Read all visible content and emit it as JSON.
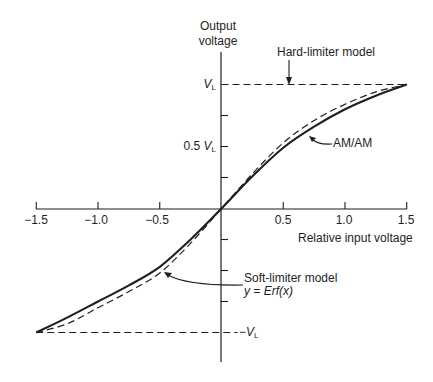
{
  "chart_data": {
    "type": "line",
    "title": "",
    "xlabel": "Relative input voltage",
    "ylabel": "Output voltage",
    "xlim": [
      -1.5,
      1.5
    ],
    "ylim": [
      -1.0,
      1.0
    ],
    "x_ticks": [
      -1.5,
      -1.0,
      -0.5,
      0.5,
      1.0,
      1.5
    ],
    "x_tick_labels": [
      "−1.5",
      "−1.0",
      "−0.5",
      "0.5",
      "1.0",
      "1.5"
    ],
    "y_ticks": [
      -1.0,
      -0.75,
      -0.5,
      -0.25,
      0.25,
      0.5,
      0.75,
      1.0
    ],
    "y_tick_labels": {
      "1.0": "V_L",
      "0.5": "0.5 V_L",
      "-1.0": "−V_L"
    },
    "grid": false,
    "x": [
      -1.5,
      -1.25,
      -1.0,
      -0.75,
      -0.5,
      -0.25,
      0,
      0.25,
      0.5,
      0.75,
      1.0,
      1.25,
      1.5
    ],
    "series": [
      {
        "name": "AM/AM",
        "style": "solid",
        "values": [
          -1.0,
          -0.88,
          -0.75,
          -0.62,
          -0.47,
          -0.25,
          0,
          0.26,
          0.49,
          0.66,
          0.8,
          0.91,
          1.0
        ]
      },
      {
        "name": "Soft-limiter model y = Erf(x)",
        "style": "dashed",
        "values": [
          -1.0,
          -0.93,
          -0.8,
          -0.67,
          -0.52,
          -0.28,
          0,
          0.28,
          0.53,
          0.71,
          0.84,
          0.94,
          1.0
        ]
      },
      {
        "name": "Hard-limiter model",
        "style": "dashed",
        "segments": [
          {
            "x": [
              0,
              1.5
            ],
            "y": [
              1.0,
              1.0
            ]
          },
          {
            "x": [
              -1.5,
              0.13
            ],
            "y": [
              -1.0,
              -1.0
            ]
          }
        ]
      }
    ],
    "annotations": [
      "Hard-limiter model",
      "AM/AM",
      "Soft-limiter model",
      "y = Erf(x)"
    ]
  },
  "labels": {
    "y_axis_line1": "Output",
    "y_axis_line2": "voltage",
    "x_axis": "Relative input voltage",
    "hard_limiter": "Hard-limiter model",
    "am_am": "AM/AM",
    "soft_limiter": "Soft-limiter model",
    "erf_formula": "y = Erf(x)",
    "vl_main": "V",
    "vl_sub": "L",
    "half_prefix": "0.5 ",
    "neg_prefix": "−"
  },
  "colors": {
    "ink": "#1e1e1e",
    "background": "#ffffff"
  }
}
